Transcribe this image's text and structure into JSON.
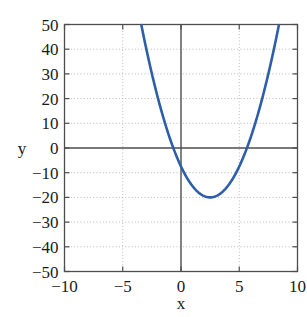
{
  "chart_data": {
    "type": "line",
    "title": "",
    "xlabel": "x",
    "ylabel": "y",
    "xlim": [
      -10,
      10
    ],
    "ylim": [
      -50,
      50
    ],
    "xticks": [
      -10,
      -5,
      0,
      5,
      10
    ],
    "xtick_labels": [
      "−10",
      "−5",
      "0",
      "5",
      "10"
    ],
    "yticks": [
      -50,
      -40,
      -30,
      -20,
      -10,
      0,
      10,
      20,
      30,
      40,
      50
    ],
    "ytick_labels": [
      "−50",
      "−40",
      "−30",
      "−20",
      "−10",
      "0",
      "10",
      "20",
      "30",
      "40",
      "50"
    ],
    "grid": true,
    "grid_style": "dotted",
    "grid_color": "#b9b9b9",
    "axis_color": "#4d4d4d",
    "background": "#ffffff",
    "legend": null,
    "series": [
      {
        "name": "parabola",
        "color": "#2d5fa8",
        "linewidth": 2.6,
        "equation": "y = 2x^2 - 10x - 12.5",
        "vertex": [
          2.5,
          -20
        ],
        "roots": [
          -0.66,
          5.66
        ],
        "x": [
          -3.33,
          -3.0,
          -2.5,
          -2.0,
          -1.5,
          -1.0,
          -0.5,
          0.0,
          0.5,
          1.0,
          1.5,
          2.0,
          2.5,
          3.0,
          3.5,
          4.0,
          4.5,
          5.0,
          5.5,
          6.0,
          6.5,
          7.0,
          7.5,
          8.0,
          8.33
        ],
        "y": [
          43.0,
          35.5,
          25.0,
          15.5,
          7.0,
          -0.5,
          -7.0,
          -12.5,
          -17.0,
          -20.5,
          -23.0,
          -24.5,
          -25.0,
          -24.5,
          -23.0,
          -20.5,
          -17.0,
          -12.5,
          -7.0,
          -0.5,
          7.0,
          15.5,
          25.0,
          35.5,
          43.0
        ],
        "visible_x_range": [
          -3.33,
          8.33
        ]
      }
    ]
  },
  "axis_labels": {
    "x": "x",
    "y": "y"
  }
}
